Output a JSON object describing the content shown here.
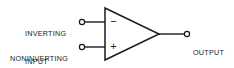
{
  "diagram": {
    "type": "op-amp-symbol",
    "background_color": "#ffffff",
    "line_color": "#1a1a1a",
    "width": 234,
    "height": 68
  },
  "component": {
    "name": "operational-amplifier",
    "shape": "triangle",
    "orientation": "points-right",
    "vertices": {
      "top_left": [
        105,
        8
      ],
      "bottom_left": [
        105,
        60
      ],
      "apex_right": [
        159,
        34
      ]
    }
  },
  "pins": {
    "inverting": {
      "label_line1": "INVERTING",
      "label_line2": "INPUT",
      "polarity_symbol": "−",
      "terminal_x": 82,
      "terminal_y": 22,
      "wire_end_x": 105
    },
    "noninverting": {
      "label_line1": "NONINVERTING",
      "label_line2": "INPUT",
      "polarity_symbol": "+",
      "terminal_x": 82,
      "terminal_y": 47,
      "wire_end_x": 105
    },
    "output": {
      "label_line1": "OUTPUT",
      "terminal_x": 187,
      "terminal_y": 34,
      "wire_start_x": 159
    }
  },
  "terminal_style": {
    "radius": 2.6,
    "fill": "#ffffff",
    "stroke": "#1a1a1a"
  }
}
